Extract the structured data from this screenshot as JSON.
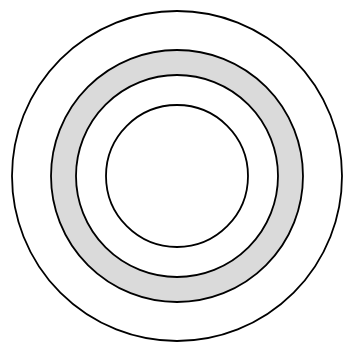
{
  "figure": {
    "canvas": {
      "width": 354,
      "height": 352,
      "background_color": "#ffffff"
    },
    "center": {
      "cx": 177,
      "cy": 176
    },
    "stroke_color": "#000000",
    "stroke_width": 1.8,
    "shaded_fill_color": "#dadada",
    "unshaded_fill_color": "#ffffff"
  },
  "chart_data": {
    "type": "diagram",
    "subtype": "concentric-annulus",
    "xlabel": "",
    "ylabel": "",
    "units": "pixels",
    "center": {
      "x": 177,
      "y": 176
    },
    "circles": [
      {
        "name": "outer-circle",
        "radius": 165,
        "fill": "#ffffff",
        "stroke": "#000000",
        "shaded": false
      },
      {
        "name": "band-outer-circle",
        "radius": 126,
        "fill": "#dadada",
        "stroke": "#000000",
        "shaded": true
      },
      {
        "name": "band-inner-circle",
        "radius": 101,
        "fill": "#ffffff",
        "stroke": "#000000",
        "shaded": false
      },
      {
        "name": "inner-circle",
        "radius": 71,
        "fill": "#ffffff",
        "stroke": "#000000",
        "shaded": false
      }
    ],
    "regions": [
      {
        "name": "outer-white-annulus",
        "inner_radius": 126,
        "outer_radius": 165,
        "fill": "#ffffff"
      },
      {
        "name": "shaded-annulus",
        "inner_radius": 101,
        "outer_radius": 126,
        "fill": "#dadada"
      },
      {
        "name": "middle-white-annulus",
        "inner_radius": 71,
        "outer_radius": 101,
        "fill": "#ffffff"
      },
      {
        "name": "inner-white-disc",
        "inner_radius": 0,
        "outer_radius": 71,
        "fill": "#ffffff"
      }
    ],
    "legend": [],
    "annotations": [],
    "grid": false
  }
}
